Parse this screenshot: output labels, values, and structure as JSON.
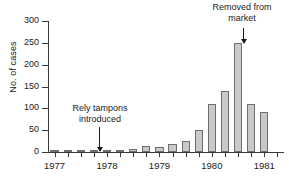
{
  "chart_data": {
    "type": "bar",
    "title": "",
    "xlabel": "",
    "ylabel": "No. of cases",
    "ylim": [
      0,
      300
    ],
    "yticks": [
      0,
      50,
      100,
      150,
      200,
      250,
      300
    ],
    "grid": false,
    "legend": null,
    "x_tick_labels": [
      "1977",
      "1978",
      "1979",
      "1980",
      "1981"
    ],
    "categories": [
      "1977 Q1",
      "1977 Q2",
      "1977 Q3",
      "1977 Q4",
      "1978 Q1",
      "1978 Q2",
      "1978 Q3",
      "1978 Q4",
      "1979 Q1",
      "1979 Q2",
      "1979 Q3",
      "1979 Q4",
      "1980 Q1",
      "1980 Q2",
      "1980 Q3",
      "1980 Q4",
      "1981 Q1"
    ],
    "values": [
      1,
      2,
      2,
      1,
      4,
      2,
      7,
      14,
      11,
      19,
      25,
      50,
      110,
      139,
      249,
      110,
      91
    ],
    "annotations": [
      {
        "text": "Rely tampons\nintroduced",
        "points_to": "1977 Q4"
      },
      {
        "text": "Removed from\nmarket",
        "points_to": "1980 Q3"
      }
    ],
    "bar_color": "#c9c9c9",
    "bar_edge_color": "#6e6e6e",
    "axis_color": "#3a3a3a"
  }
}
